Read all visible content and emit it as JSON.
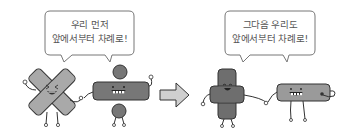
{
  "panels": [
    {
      "bubble": {
        "line1": "우리 먼저",
        "line2": "앞에서부터 차례로!"
      },
      "characters": [
        {
          "name": "multiply-sign",
          "symbol": "×",
          "tone": "#a9a9a9"
        },
        {
          "name": "divide-sign",
          "symbol": "÷",
          "tone": "#777777"
        }
      ]
    },
    {
      "bubble": {
        "line1": "그다음 우리도",
        "line2": "앞에서부터 차례로!"
      },
      "characters": [
        {
          "name": "plus-sign",
          "symbol": "+",
          "tone": "#6e6e6e"
        },
        {
          "name": "minus-sign",
          "symbol": "−",
          "tone": "#9a9a9a"
        }
      ]
    }
  ],
  "arrow": {
    "direction": "right",
    "tone": "#cfcfcf"
  },
  "colors": {
    "outline": "#333333",
    "bubble_border": "#666666",
    "text": "#555555",
    "background": "#ffffff"
  }
}
